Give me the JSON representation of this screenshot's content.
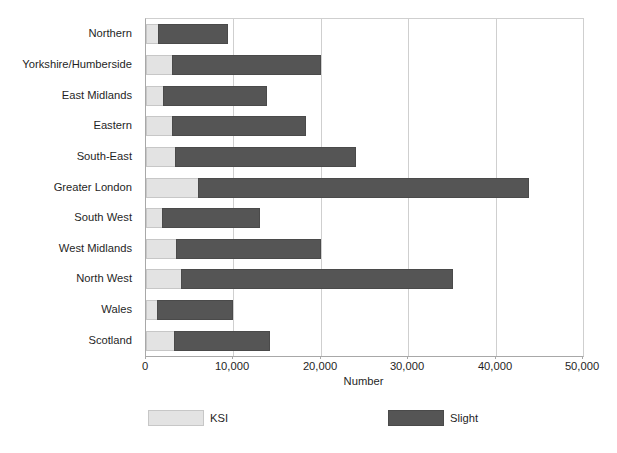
{
  "chart_data": {
    "type": "bar",
    "orientation": "horizontal",
    "stacked": true,
    "title": "",
    "xlabel": "Number",
    "ylabel": "",
    "xlim": [
      0,
      50000
    ],
    "xticks": [
      0,
      10000,
      20000,
      30000,
      40000,
      50000
    ],
    "xtick_labels": [
      "0",
      "10,000",
      "20,000",
      "30,000",
      "40,000",
      "50,000"
    ],
    "grid": "vertical",
    "legend_position": "bottom",
    "categories": [
      "Northern",
      "Yorkshire/Humberside",
      "East Midlands",
      "Eastern",
      "South-East",
      "Greater London",
      "South West",
      "West Midlands",
      "North West",
      "Wales",
      "Scotland"
    ],
    "series": [
      {
        "name": "KSI",
        "color": "#e3e3e3",
        "values": [
          1400,
          3000,
          1900,
          3000,
          3300,
          6000,
          1800,
          3400,
          4000,
          1300,
          3200
        ]
      },
      {
        "name": "Slight",
        "color": "#555555",
        "values": [
          8000,
          17000,
          11900,
          15300,
          20700,
          37800,
          11200,
          16600,
          31100,
          8600,
          11000
        ]
      }
    ],
    "totals": [
      9400,
      20000,
      13800,
      18300,
      24000,
      43800,
      13000,
      20000,
      35100,
      9900,
      14200
    ]
  },
  "legend": {
    "items": [
      {
        "label": "KSI",
        "color": "#e3e3e3"
      },
      {
        "label": "Slight",
        "color": "#555555"
      }
    ]
  },
  "colors": {
    "ksi": "#e3e3e3",
    "slight": "#555555",
    "gridline": "#cfcfcf",
    "axis": "#a8a8a8",
    "text": "#1f1f1f",
    "background": "#ffffff"
  }
}
